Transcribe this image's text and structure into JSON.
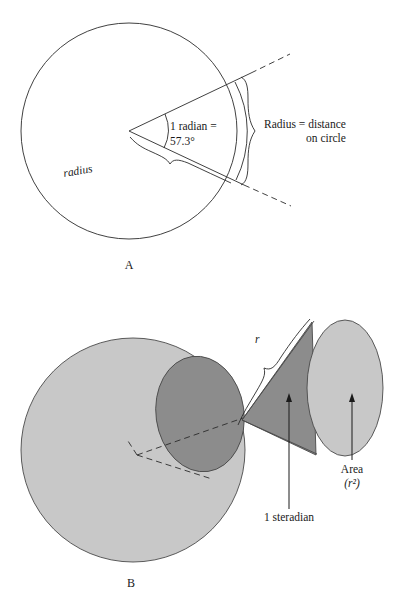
{
  "figure": {
    "background": "#ffffff",
    "ink": "#1a1a1a"
  },
  "colors": {
    "sphere_fill": "#c8c8c8",
    "cap_fill": "#8c8c8c",
    "cone_fill": "#8c8c8c",
    "disc_fill": "#c8c8c8",
    "stroke": "#2b2b2b"
  },
  "panel_a": {
    "label": "A",
    "angle_label_line1": "1 radian =",
    "angle_label_line2": "57.3°",
    "radius_label": "radius",
    "brace_label_line1": "Radius = distance",
    "brace_label_line2": "on circle",
    "geometry": {
      "circle_center_x": 129,
      "circle_center_y": 131,
      "circle_radius": 108,
      "angle_degrees": 57.3
    }
  },
  "panel_b": {
    "label": "B",
    "r_label": "r",
    "steradian_label": "1 steradian",
    "area_label": "Area",
    "area_value": "(r²)",
    "geometry": {
      "sphere_center_x": 133,
      "sphere_center_y": 450,
      "sphere_radius": 112,
      "cone_apex_x": 242,
      "cone_apex_y": 420,
      "disc_center_x": 345,
      "disc_center_y": 388,
      "disc_rx": 38,
      "disc_ry": 68
    }
  }
}
